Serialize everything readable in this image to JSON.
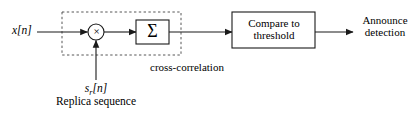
{
  "figure": {
    "background_color": "#ffffff",
    "line_color": "#1a1a1a"
  },
  "labels": {
    "input_signal": "x[n]",
    "replica_symbol": "s",
    "replica_symbol_sub": "r",
    "replica_symbol_index": "[n]",
    "replica_caption": "Replica sequence",
    "cross_correlation": "cross-correlation",
    "announce_line1": "Announce",
    "announce_line2": "detection",
    "multiplier_symbol": "×",
    "summation_symbol": "Σ",
    "compare_line1": "Compare to",
    "compare_line2": "threshold"
  },
  "blocks": [
    {
      "name": "summation-block",
      "symbol": "Σ",
      "x": 136,
      "y": 20,
      "width": 33,
      "height": 24
    },
    {
      "name": "compare-block",
      "text": "Compare to threshold",
      "x": 232,
      "y": 12,
      "width": 83,
      "height": 36
    }
  ],
  "multiplier": {
    "name": "multiplier-node",
    "symbol": "×",
    "cx": 96,
    "cy": 32,
    "r": 8
  },
  "dashed_region": {
    "name": "cross-correlation-region",
    "label": "cross-correlation",
    "x": 62,
    "y": 12,
    "width": 119,
    "height": 43,
    "style": "dashed"
  },
  "connections": [
    {
      "name": "input-to-multiplier",
      "from": "x[n]",
      "to": "multiplier",
      "direction": "right"
    },
    {
      "name": "replica-to-multiplier",
      "from": "s_r[n]",
      "to": "multiplier",
      "direction": "up"
    },
    {
      "name": "multiplier-to-summation",
      "from": "multiplier",
      "to": "summation",
      "direction": "right"
    },
    {
      "name": "summation-to-compare",
      "from": "summation",
      "to": "compare",
      "direction": "right"
    },
    {
      "name": "compare-to-output",
      "from": "compare",
      "to": "announce detection",
      "direction": "right"
    }
  ]
}
